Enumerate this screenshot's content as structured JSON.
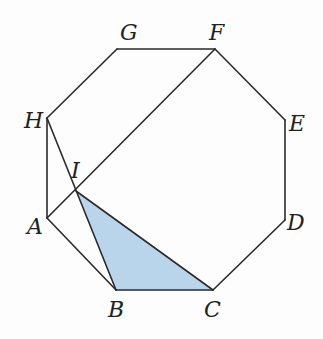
{
  "diagram": {
    "colors": {
      "stroke": "#2a2a2a",
      "fill": "#b9d5ec",
      "label": "#222222"
    },
    "points": {
      "A": {
        "label": "A",
        "x": 47,
        "y": 218
      },
      "B": {
        "label": "B",
        "x": 116,
        "y": 290
      },
      "C": {
        "label": "C",
        "x": 213,
        "y": 290
      },
      "D": {
        "label": "D",
        "x": 285,
        "y": 220
      },
      "E": {
        "label": "E",
        "x": 285,
        "y": 120
      },
      "F": {
        "label": "F",
        "x": 215,
        "y": 49
      },
      "G": {
        "label": "G",
        "x": 117,
        "y": 49
      },
      "H": {
        "label": "H",
        "x": 47,
        "y": 118
      },
      "I": {
        "label": "I",
        "x": 76,
        "y": 191
      }
    },
    "labels": {
      "A": "A",
      "B": "B",
      "C": "C",
      "D": "D",
      "E": "E",
      "F": "F",
      "G": "G",
      "H": "H",
      "I": "I"
    },
    "segments": [
      [
        "A",
        "B"
      ],
      [
        "B",
        "C"
      ],
      [
        "C",
        "D"
      ],
      [
        "D",
        "E"
      ],
      [
        "E",
        "F"
      ],
      [
        "F",
        "G"
      ],
      [
        "G",
        "H"
      ],
      [
        "H",
        "A"
      ],
      [
        "A",
        "F"
      ],
      [
        "H",
        "B"
      ],
      [
        "I",
        "C"
      ]
    ],
    "shaded_region": [
      "I",
      "B",
      "C"
    ]
  }
}
